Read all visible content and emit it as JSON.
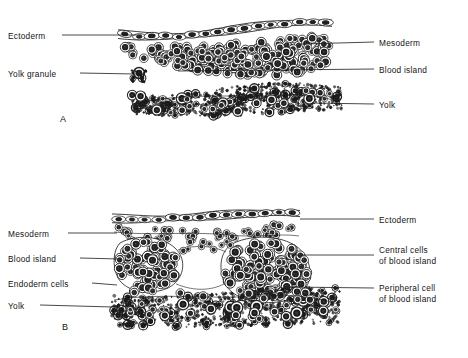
{
  "figure": {
    "background": "#ffffff",
    "ink": "#141414",
    "panels": [
      {
        "id": "A",
        "letter": "A",
        "letter_pos": {
          "x": 60,
          "y": 114
        },
        "labels_left": [
          {
            "name": "ectoderm",
            "text": "Ectoderm",
            "x": 8,
            "y": 31,
            "leader": {
              "x1": 62,
              "y1": 35,
              "x2": 142,
              "y2": 35
            }
          },
          {
            "name": "yolk-granule",
            "text": "Yolk granule",
            "x": 8,
            "y": 69,
            "leader": {
              "x1": 80,
              "y1": 73,
              "x2": 136,
              "y2": 74
            }
          }
        ],
        "labels_right": [
          {
            "name": "mesoderm",
            "text": "Mesoderm",
            "x": 379,
            "y": 38,
            "leader": {
              "x1": 302,
              "y1": 44,
              "x2": 374,
              "y2": 42
            }
          },
          {
            "name": "blood-island",
            "text": "Blood island",
            "x": 379,
            "y": 65,
            "leader": {
              "x1": 178,
              "y1": 71,
              "x2": 374,
              "y2": 69
            }
          },
          {
            "name": "yolk",
            "text": "Yolk",
            "x": 379,
            "y": 100,
            "leader": {
              "x1": 312,
              "y1": 103,
              "x2": 374,
              "y2": 104
            }
          }
        ]
      },
      {
        "id": "B",
        "letter": "B",
        "letter_pos": {
          "x": 62,
          "y": 322
        },
        "labels_left": [
          {
            "name": "mesoderm",
            "text": "Mesoderm",
            "x": 8,
            "y": 229,
            "leader": {
              "x1": 68,
              "y1": 233,
              "x2": 117,
              "y2": 233
            }
          },
          {
            "name": "blood-island",
            "text": "Blood island",
            "x": 8,
            "y": 254,
            "leader": {
              "x1": 80,
              "y1": 258,
              "x2": 120,
              "y2": 259
            }
          },
          {
            "name": "endoderm-cells",
            "text": "Endoderm cells",
            "x": 8,
            "y": 279,
            "leader": {
              "x1": 92,
              "y1": 283,
              "x2": 117,
              "y2": 285
            }
          },
          {
            "name": "yolk",
            "text": "Yolk",
            "x": 8,
            "y": 301,
            "leader": {
              "x1": 40,
              "y1": 305,
              "x2": 113,
              "y2": 307
            }
          }
        ],
        "labels_right": [
          {
            "name": "ectoderm",
            "text": "Ectoderm",
            "x": 379,
            "y": 215,
            "leader": {
              "x1": 300,
              "y1": 219,
              "x2": 374,
              "y2": 219
            }
          },
          {
            "name": "central-cells",
            "text": "Central cells\nof blood island",
            "x": 379,
            "y": 245,
            "leader": {
              "x1": 293,
              "y1": 255,
              "x2": 374,
              "y2": 255
            }
          },
          {
            "name": "peripheral-cell",
            "text": "Peripheral cell\nof blood island",
            "x": 379,
            "y": 283,
            "leader": {
              "x1": 290,
              "y1": 287,
              "x2": 374,
              "y2": 288
            }
          }
        ]
      }
    ],
    "structures": [
      {
        "name": "ectoderm-epithelium-a",
        "panel": "A",
        "description": "thin squamous epithelial sheet of elongated cells with dark nuclei"
      },
      {
        "name": "mesoderm-layer-a",
        "panel": "A",
        "description": "loose layer of rounded cells beneath ectoderm"
      },
      {
        "name": "blood-island-a",
        "panel": "A",
        "description": "aggregated mass of rounded vacuolated cells"
      },
      {
        "name": "yolk-mass-a",
        "panel": "A",
        "description": "dense stippled band of yolk granules"
      },
      {
        "name": "ectoderm-epithelium-b",
        "panel": "B",
        "description": "thin squamous epithelial sheet at top"
      },
      {
        "name": "mesoderm-layer-b",
        "panel": "B",
        "description": "scattered rounded mesoderm cells"
      },
      {
        "name": "blood-island-left-b",
        "panel": "B",
        "description": "rounded cluster of blood island cells, left"
      },
      {
        "name": "blood-island-right-b",
        "panel": "B",
        "description": "larger rounded cluster of blood island cells, right"
      },
      {
        "name": "cavity-b",
        "panel": "B",
        "description": "clear lumen between the two blood islands"
      },
      {
        "name": "endoderm-yolk-b",
        "panel": "B",
        "description": "dense stippled yolk/endoderm band at bottom"
      }
    ]
  }
}
